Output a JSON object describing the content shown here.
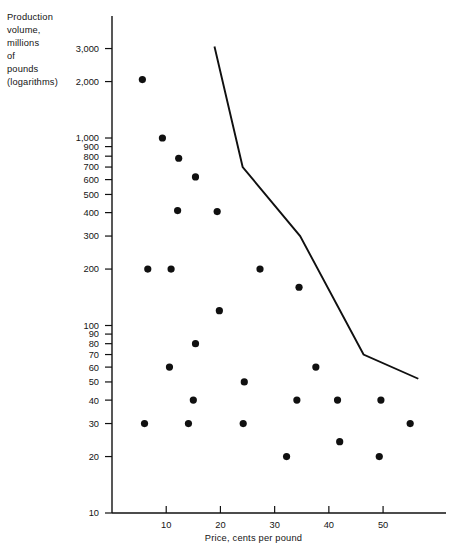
{
  "chart_data": {
    "type": "scatter",
    "title": "",
    "ylabel": "Production\nvolume,\nmillions\nof\npounds\n(logarithms)",
    "xlabel": "Price, cents per pound",
    "xlim": [
      0,
      60.5
    ],
    "ylim": [
      10,
      3500
    ],
    "yscale": "log",
    "grid": false,
    "legend": null,
    "xticks": [
      0,
      10,
      20,
      30,
      40,
      50
    ],
    "xtick_labels": [
      "",
      "10",
      "20",
      "30",
      "40",
      "50"
    ],
    "yticks": [
      10,
      20,
      30,
      40,
      50,
      60,
      70,
      80,
      90,
      100,
      200,
      300,
      400,
      500,
      600,
      700,
      800,
      900,
      1000,
      2000,
      3000
    ],
    "ytick_labels": [
      "10",
      "20",
      "30",
      "40",
      "50",
      "60",
      "70",
      "80",
      "90",
      "100",
      "200",
      "300",
      "400",
      "500",
      "600",
      "700",
      "800",
      "900",
      "1,000",
      "2,000",
      "3,000"
    ],
    "point_color": "#101010",
    "line_color": "#101010",
    "points": [
      {
        "x": 5.6,
        "y": 2050
      },
      {
        "x": 6.6,
        "y": 200
      },
      {
        "x": 6.0,
        "y": 30
      },
      {
        "x": 9.3,
        "y": 1000
      },
      {
        "x": 10.6,
        "y": 60
      },
      {
        "x": 10.9,
        "y": 200
      },
      {
        "x": 12.3,
        "y": 780
      },
      {
        "x": 12.1,
        "y": 410
      },
      {
        "x": 14.1,
        "y": 30
      },
      {
        "x": 15.4,
        "y": 620
      },
      {
        "x": 15.4,
        "y": 80
      },
      {
        "x": 15.0,
        "y": 40
      },
      {
        "x": 19.4,
        "y": 405
      },
      {
        "x": 19.8,
        "y": 120
      },
      {
        "x": 24.4,
        "y": 50
      },
      {
        "x": 24.2,
        "y": 30
      },
      {
        "x": 27.3,
        "y": 200
      },
      {
        "x": 32.2,
        "y": 20
      },
      {
        "x": 34.1,
        "y": 40
      },
      {
        "x": 34.5,
        "y": 160
      },
      {
        "x": 37.6,
        "y": 60
      },
      {
        "x": 41.6,
        "y": 40
      },
      {
        "x": 42.0,
        "y": 24
      },
      {
        "x": 49.6,
        "y": 40
      },
      {
        "x": 49.3,
        "y": 20
      },
      {
        "x": 55.0,
        "y": 30
      }
    ],
    "frontier_line": [
      {
        "x": 18.9,
        "y": 3080
      },
      {
        "x": 24.1,
        "y": 700
      },
      {
        "x": 34.7,
        "y": 300
      },
      {
        "x": 46.4,
        "y": 70
      },
      {
        "x": 56.5,
        "y": 52
      }
    ]
  }
}
